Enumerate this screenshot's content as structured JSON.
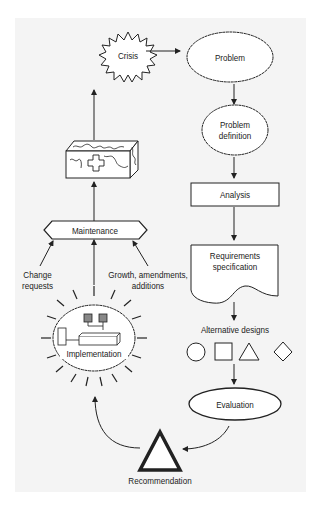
{
  "diagram": {
    "type": "system-development-life-cycle",
    "nodes": {
      "crisis": "Crisis",
      "problem": "Problem",
      "problem_definition_line1": "Problem",
      "problem_definition_line2": "definition",
      "analysis": "Analysis",
      "requirements_line1": "Requirements",
      "requirements_line2": "specification",
      "alternative_designs": "Alternative designs",
      "evaluation": "Evaluation",
      "recommendation": "Recommendation",
      "implementation": "Implementation",
      "maintenance": "Maintenance"
    },
    "edge_labels": {
      "change_requests_line1": "Change",
      "change_requests_line2": "requests",
      "growth_line1": "Growth, amendments,",
      "growth_line2": "additions"
    },
    "alternative_shapes": [
      "circle",
      "square",
      "triangle",
      "diamond"
    ],
    "edges": [
      [
        "Crisis",
        "Problem"
      ],
      [
        "Problem",
        "Problem definition"
      ],
      [
        "Problem definition",
        "Analysis"
      ],
      [
        "Analysis",
        "Requirements specification"
      ],
      [
        "Requirements specification",
        "Alternative designs"
      ],
      [
        "Alternative designs",
        "Evaluation"
      ],
      [
        "Evaluation",
        "Recommendation"
      ],
      [
        "Recommendation",
        "Implementation"
      ],
      [
        "Implementation",
        "Maintenance"
      ],
      [
        "Maintenance",
        "Broken system"
      ],
      [
        "Broken system",
        "Crisis"
      ]
    ]
  },
  "colors": {
    "background": "#f4f4f4",
    "stroke": "#222222",
    "fill": "#ffffff",
    "monitor": "#888888"
  }
}
